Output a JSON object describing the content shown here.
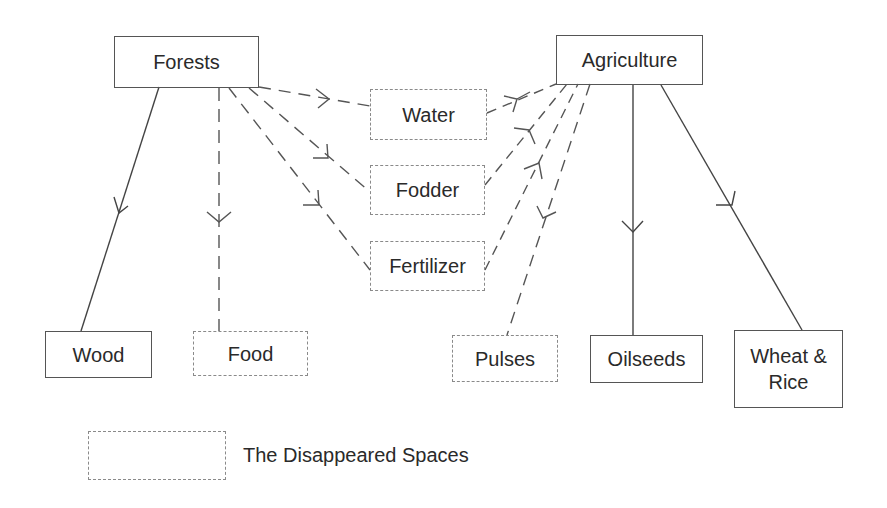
{
  "diagram": {
    "nodes": {
      "forests": {
        "label": "Forests",
        "style": "solid"
      },
      "agriculture": {
        "label": "Agriculture",
        "style": "solid"
      },
      "water": {
        "label": "Water",
        "style": "dashed"
      },
      "fodder": {
        "label": "Fodder",
        "style": "dashed"
      },
      "fertilizer": {
        "label": "Fertilizer",
        "style": "dashed"
      },
      "wood": {
        "label": "Wood",
        "style": "solid"
      },
      "food": {
        "label": "Food",
        "style": "dashed"
      },
      "pulses": {
        "label": "Pulses",
        "style": "dashed"
      },
      "oilseeds": {
        "label": "Oilseeds",
        "style": "solid"
      },
      "wheat_rice": {
        "label": "Wheat & Rice",
        "line1": "Wheat &",
        "line2": "Rice",
        "style": "solid"
      }
    },
    "edges": [
      {
        "from": "Forests",
        "to": "Wood",
        "style": "solid"
      },
      {
        "from": "Forests",
        "to": "Food",
        "style": "dashed"
      },
      {
        "from": "Forests",
        "to": "Water",
        "style": "dashed"
      },
      {
        "from": "Forests",
        "to": "Fodder",
        "style": "dashed"
      },
      {
        "from": "Forests",
        "to": "Fertilizer",
        "style": "dashed"
      },
      {
        "from": "Water",
        "to": "Agriculture",
        "style": "dashed"
      },
      {
        "from": "Fodder",
        "to": "Agriculture",
        "style": "dashed"
      },
      {
        "from": "Fertilizer",
        "to": "Agriculture",
        "style": "dashed"
      },
      {
        "from": "Agriculture",
        "to": "Pulses",
        "style": "dashed"
      },
      {
        "from": "Agriculture",
        "to": "Oilseeds",
        "style": "solid"
      },
      {
        "from": "Agriculture",
        "to": "Wheat & Rice",
        "style": "solid"
      }
    ],
    "legend": {
      "label": "The Disappeared Spaces",
      "symbol": "dashed-box"
    },
    "colors": {
      "solid_stroke": "#555555",
      "dashed_stroke": "#8a8a8a",
      "text": "#2a2a2a",
      "background": "#ffffff"
    }
  }
}
